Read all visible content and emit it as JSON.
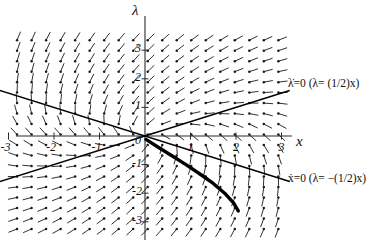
{
  "chart_data": {
    "type": "scatter",
    "subtype": "vector-field-phase-portrait",
    "title": "",
    "xlabel": "x",
    "ylabel": "λ",
    "xlim": [
      -3.6,
      3.4
    ],
    "ylim": [
      -3.4,
      3.5
    ],
    "grid": false,
    "legend": "none",
    "x_ticks": [
      -3,
      -2,
      -1,
      0,
      1,
      2,
      3
    ],
    "x_tick_labels": [
      "-3",
      "-2",
      "-1",
      "0",
      "1",
      "2",
      "3"
    ],
    "y_ticks": [
      -3,
      -2,
      -1,
      1,
      2,
      3
    ],
    "y_tick_labels": [
      "-3",
      "-2",
      "-1",
      "1",
      "2",
      "3"
    ],
    "origin_label": "0",
    "nullclines": [
      {
        "name": "lambda-dot-nullcline",
        "label": "λ̇=0 (λ= (1/2)x)",
        "label_math": "lambda_dot = 0",
        "equation": "lambda = (1/2)x",
        "slope": 0.5,
        "intercept": 0,
        "style": "solid",
        "label_x": 3.45,
        "label_y": 1.72
      },
      {
        "name": "x-dot-nullcline",
        "label": "ẋ=0 (λ= −(1/2)x)",
        "label_math": "x_dot = 0",
        "equation": "lambda = -(1/2)x",
        "slope": -0.5,
        "intercept": 0,
        "style": "solid",
        "label_x": 3.45,
        "label_y": -1.72
      }
    ],
    "trajectory": {
      "name": "stable-manifold-trajectory",
      "style": "thick-solid",
      "description": "heavy curve from origin descending into fourth quadrant",
      "points": [
        [
          0.02,
          -0.12
        ],
        [
          0.3,
          -0.4
        ],
        [
          0.6,
          -0.7
        ],
        [
          0.9,
          -1.0
        ],
        [
          1.2,
          -1.32
        ],
        [
          1.5,
          -1.66
        ],
        [
          1.75,
          -2.0
        ],
        [
          1.95,
          -2.35
        ],
        [
          2.05,
          -2.62
        ]
      ]
    },
    "field": {
      "name": "direction-field",
      "u_expression": "x + 2*lambda",
      "v_expression": "2*lambda - x",
      "arrow_count_x": 22,
      "arrow_count_y": 19,
      "x_range": [
        -3.45,
        3.25
      ],
      "y_range": [
        -3.25,
        3.35
      ],
      "marker": "dot-at-tail",
      "color": "#1a1a1a"
    },
    "colors": {
      "background": "#ffffff",
      "axis": "#2b2b2b",
      "field": "#1a1a1a",
      "nullcline": "#000000",
      "trajectory": "#000000",
      "text": "#111111"
    }
  }
}
